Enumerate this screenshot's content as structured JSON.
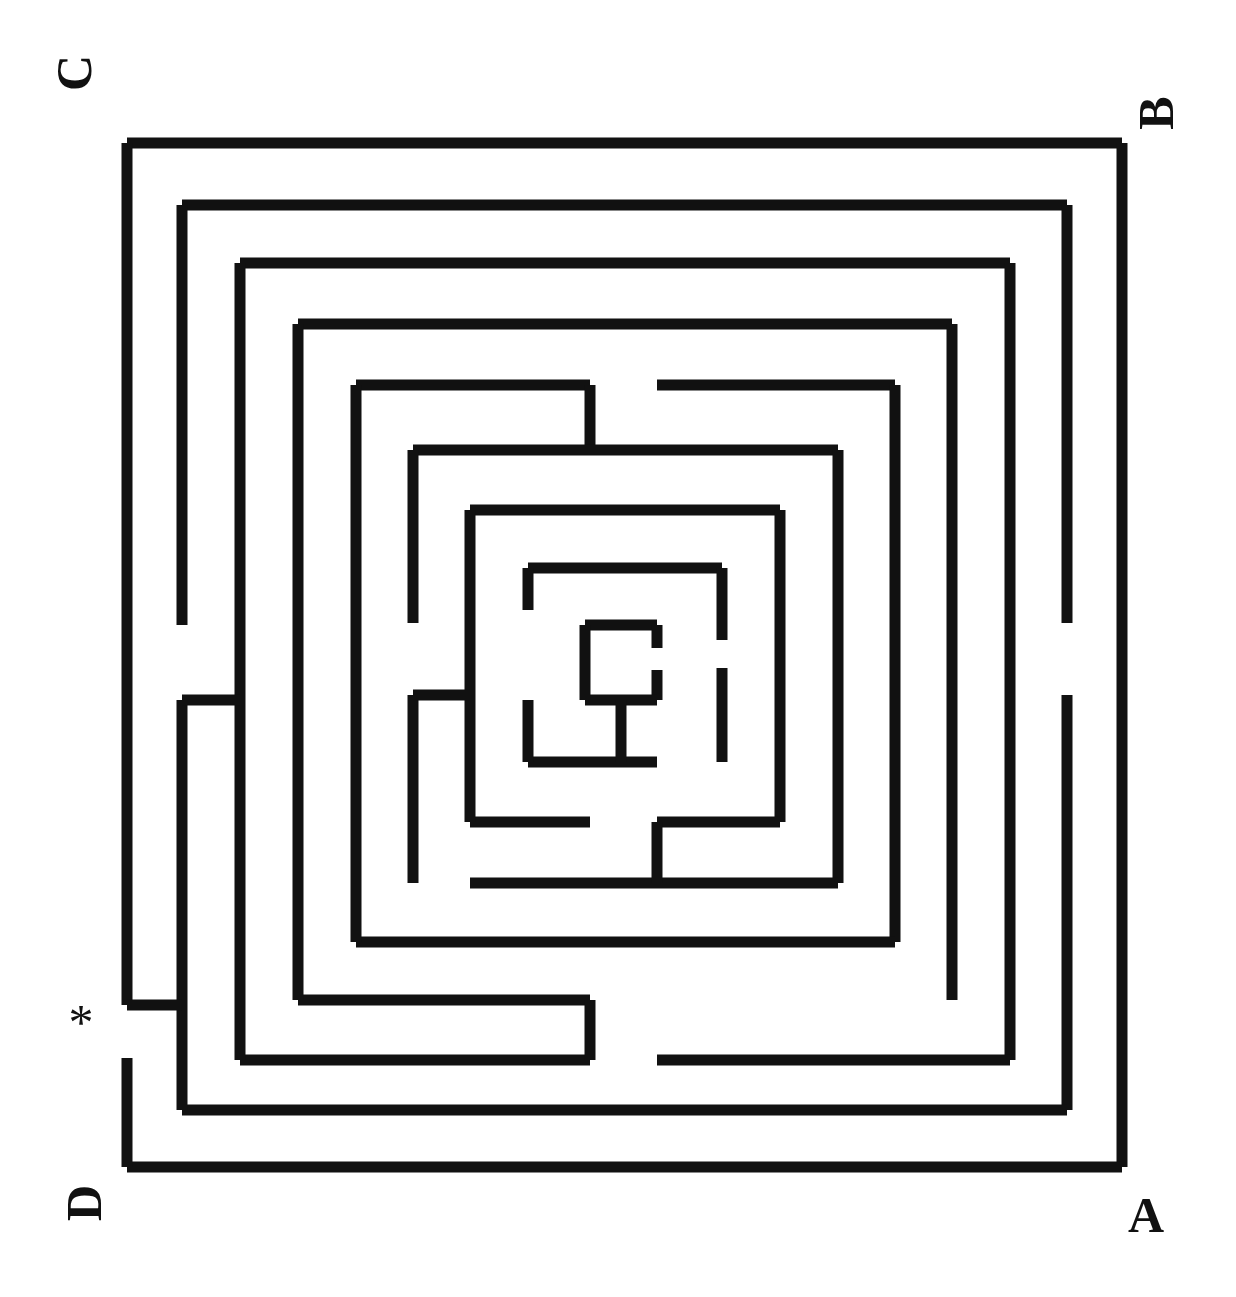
{
  "figure": {
    "type": "labyrinth-maze-diagram",
    "background_color": "#ffffff",
    "wall_color": "#111111",
    "wall_thickness": 11,
    "canvas": {
      "width": 1236,
      "height": 1297
    }
  },
  "labels": {
    "corner_a": {
      "text": "A",
      "rotated": false,
      "position": "bottom-right"
    },
    "corner_b": {
      "text": "B",
      "rotated": true,
      "position": "top-right"
    },
    "corner_c": {
      "text": "C",
      "rotated": true,
      "position": "top-left"
    },
    "corner_d": {
      "text": "D",
      "rotated": true,
      "position": "bottom-left"
    },
    "entrance_marker": {
      "text": "*",
      "position": "left-lower",
      "meaning": "entrance"
    }
  },
  "chart_data": {
    "type": "diagram",
    "title": "",
    "rings": [
      {
        "index": 1,
        "left": 127,
        "top": 143,
        "right": 1122,
        "bottom": 1167
      },
      {
        "index": 2,
        "left": 182,
        "top": 205,
        "right": 1067,
        "bottom": 1110
      },
      {
        "index": 3,
        "left": 240,
        "top": 263,
        "right": 1010,
        "bottom": 1060
      },
      {
        "index": 4,
        "left": 298,
        "top": 324,
        "right": 952,
        "bottom": 1000
      },
      {
        "index": 5,
        "left": 356,
        "top": 385,
        "right": 895,
        "bottom": 942
      },
      {
        "index": 6,
        "left": 413,
        "top": 450,
        "right": 838,
        "bottom": 883
      },
      {
        "index": 7,
        "left": 470,
        "top": 510,
        "right": 780,
        "bottom": 822
      },
      {
        "index": 8,
        "left": 528,
        "top": 568,
        "right": 722,
        "bottom": 762
      },
      {
        "index": 9,
        "left": 585,
        "top": 625,
        "right": 657,
        "bottom": 700
      }
    ],
    "segments": [
      {
        "id": "r1-top",
        "x1": 127,
        "y1": 143,
        "x2": 1122,
        "y2": 143
      },
      {
        "id": "r1-right",
        "x1": 1122,
        "y1": 143,
        "x2": 1122,
        "y2": 1167
      },
      {
        "id": "r1-bottom",
        "x1": 127,
        "y1": 1167,
        "x2": 1122,
        "y2": 1167
      },
      {
        "id": "r1-left-upper",
        "x1": 127,
        "y1": 143,
        "x2": 127,
        "y2": 1005
      },
      {
        "id": "r1-left-lower",
        "x1": 127,
        "y1": 1058,
        "x2": 127,
        "y2": 1167
      },
      {
        "id": "r2-top",
        "x1": 182,
        "y1": 205,
        "x2": 1067,
        "y2": 205
      },
      {
        "id": "r2-right-up",
        "x1": 1067,
        "y1": 205,
        "x2": 1067,
        "y2": 623
      },
      {
        "id": "r2-right-dn",
        "x1": 1067,
        "y1": 695,
        "x2": 1067,
        "y2": 1110
      },
      {
        "id": "r2-bottom",
        "x1": 182,
        "y1": 1110,
        "x2": 1067,
        "y2": 1110
      },
      {
        "id": "r2-left-up",
        "x1": 182,
        "y1": 205,
        "x2": 182,
        "y2": 625
      },
      {
        "id": "r2-left-dn",
        "x1": 182,
        "y1": 700,
        "x2": 182,
        "y2": 1110
      },
      {
        "id": "r1-r2-link",
        "x1": 127,
        "y1": 1005,
        "x2": 182,
        "y2": 1005
      },
      {
        "id": "r3-top",
        "x1": 240,
        "y1": 263,
        "x2": 1010,
        "y2": 263
      },
      {
        "id": "r3-right",
        "x1": 1010,
        "y1": 263,
        "x2": 1010,
        "y2": 1060
      },
      {
        "id": "r3-bottom",
        "x1": 240,
        "y1": 1060,
        "x2": 590,
        "y2": 1060
      },
      {
        "id": "r3-bottom-b",
        "x1": 657,
        "y1": 1060,
        "x2": 1010,
        "y2": 1060
      },
      {
        "id": "r3-left",
        "x1": 240,
        "y1": 263,
        "x2": 240,
        "y2": 1060
      },
      {
        "id": "r2-r3-link",
        "x1": 182,
        "y1": 700,
        "x2": 240,
        "y2": 700
      },
      {
        "id": "r4-top",
        "x1": 298,
        "y1": 324,
        "x2": 952,
        "y2": 324
      },
      {
        "id": "r4-right-up",
        "x1": 952,
        "y1": 324,
        "x2": 952,
        "y2": 695
      },
      {
        "id": "r4-right-dn",
        "x1": 952,
        "y1": 695,
        "x2": 952,
        "y2": 1000
      },
      {
        "id": "r4-bottom",
        "x1": 298,
        "y1": 1000,
        "x2": 590,
        "y2": 1000
      },
      {
        "id": "r4-left",
        "x1": 298,
        "y1": 324,
        "x2": 298,
        "y2": 1000
      },
      {
        "id": "r4-stub-dn",
        "x1": 590,
        "y1": 1000,
        "x2": 590,
        "y2": 1060
      },
      {
        "id": "r5-top-a",
        "x1": 356,
        "y1": 385,
        "x2": 590,
        "y2": 385
      },
      {
        "id": "r5-top-b",
        "x1": 657,
        "y1": 385,
        "x2": 895,
        "y2": 385
      },
      {
        "id": "r5-right",
        "x1": 895,
        "y1": 385,
        "x2": 895,
        "y2": 942
      },
      {
        "id": "r5-bottom",
        "x1": 356,
        "y1": 942,
        "x2": 895,
        "y2": 942
      },
      {
        "id": "r5-left-up",
        "x1": 356,
        "y1": 385,
        "x2": 356,
        "y2": 700
      },
      {
        "id": "r5-left-dn",
        "x1": 356,
        "y1": 700,
        "x2": 356,
        "y2": 942
      },
      {
        "id": "r5-stub-dn",
        "x1": 590,
        "y1": 385,
        "x2": 590,
        "y2": 450
      },
      {
        "id": "r6-top",
        "x1": 413,
        "y1": 450,
        "x2": 838,
        "y2": 450
      },
      {
        "id": "r6-right",
        "x1": 838,
        "y1": 450,
        "x2": 838,
        "y2": 883
      },
      {
        "id": "r6-bottom",
        "x1": 470,
        "y1": 883,
        "x2": 838,
        "y2": 883
      },
      {
        "id": "r6-left-up",
        "x1": 413,
        "y1": 450,
        "x2": 413,
        "y2": 623
      },
      {
        "id": "r6-left-dn",
        "x1": 413,
        "y1": 695,
        "x2": 413,
        "y2": 883
      },
      {
        "id": "r7-top",
        "x1": 470,
        "y1": 510,
        "x2": 780,
        "y2": 510
      },
      {
        "id": "r7-right",
        "x1": 780,
        "y1": 510,
        "x2": 780,
        "y2": 822
      },
      {
        "id": "r7-bottom-a",
        "x1": 470,
        "y1": 822,
        "x2": 590,
        "y2": 822
      },
      {
        "id": "r7-bottom-b",
        "x1": 657,
        "y1": 822,
        "x2": 780,
        "y2": 822
      },
      {
        "id": "r7-left",
        "x1": 470,
        "y1": 510,
        "x2": 470,
        "y2": 822
      },
      {
        "id": "r7-stub-dn",
        "x1": 657,
        "y1": 822,
        "x2": 657,
        "y2": 883
      },
      {
        "id": "r6-r7-link",
        "x1": 413,
        "y1": 695,
        "x2": 470,
        "y2": 695
      },
      {
        "id": "r8-top",
        "x1": 528,
        "y1": 568,
        "x2": 722,
        "y2": 568
      },
      {
        "id": "r8-right-up",
        "x1": 722,
        "y1": 568,
        "x2": 722,
        "y2": 640
      },
      {
        "id": "r8-right-dn",
        "x1": 722,
        "y1": 668,
        "x2": 722,
        "y2": 762
      },
      {
        "id": "r8-bottom",
        "x1": 528,
        "y1": 762,
        "x2": 657,
        "y2": 762
      },
      {
        "id": "r8-left-up",
        "x1": 528,
        "y1": 568,
        "x2": 528,
        "y2": 610
      },
      {
        "id": "r8-left-dn",
        "x1": 528,
        "y1": 700,
        "x2": 528,
        "y2": 762
      },
      {
        "id": "r9-top",
        "x1": 585,
        "y1": 625,
        "x2": 657,
        "y2": 625
      },
      {
        "id": "r9-right-up",
        "x1": 657,
        "y1": 625,
        "x2": 657,
        "y2": 648
      },
      {
        "id": "r9-right-dn",
        "x1": 657,
        "y1": 670,
        "x2": 657,
        "y2": 700
      },
      {
        "id": "r9-bottom",
        "x1": 585,
        "y1": 700,
        "x2": 657,
        "y2": 700
      },
      {
        "id": "r9-left",
        "x1": 585,
        "y1": 625,
        "x2": 585,
        "y2": 700
      },
      {
        "id": "r9-stub-dn",
        "x1": 621,
        "y1": 700,
        "x2": 621,
        "y2": 762
      }
    ],
    "entrance": {
      "x": 127,
      "y": 1032,
      "label": "*"
    },
    "corner_points": {
      "A": {
        "x": 1144,
        "y": 1218
      },
      "B": {
        "x": 1156,
        "y": 116
      },
      "C": {
        "x": 74,
        "y": 76
      },
      "D": {
        "x": 84,
        "y": 1206
      }
    }
  }
}
